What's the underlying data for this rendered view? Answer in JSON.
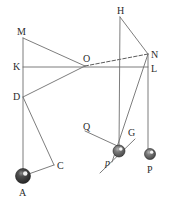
{
  "figure": {
    "width": 172,
    "height": 203,
    "background": "#ffffff",
    "stroke_color": "#6e6e6e",
    "stroke_color_dark": "#4a4a4a",
    "label_color": "#2b2b2b",
    "ball_dark": "#2e2e2e",
    "ball_mid": "#6a6a6a",
    "ball_highlight": "#ffffff"
  },
  "points": {
    "M": {
      "x": 23,
      "y": 38,
      "label": "M",
      "label_x": 17,
      "label_y": 27,
      "italic": false
    },
    "K": {
      "x": 23,
      "y": 67,
      "label": "K",
      "label_x": 13,
      "label_y": 62,
      "italic": false
    },
    "D": {
      "x": 23,
      "y": 97,
      "label": "D",
      "label_x": 13,
      "label_y": 92,
      "italic": false
    },
    "A": {
      "x": 23,
      "y": 176,
      "label": "A",
      "label_x": 19,
      "label_y": 188,
      "italic": false
    },
    "C": {
      "x": 54,
      "y": 165,
      "label": "C",
      "label_x": 57,
      "label_y": 161,
      "italic": false
    },
    "O": {
      "x": 85,
      "y": 66,
      "label": "O",
      "label_x": 83,
      "label_y": 54,
      "italic": false
    },
    "H": {
      "x": 120,
      "y": 17,
      "label": "H",
      "label_x": 117,
      "label_y": 6,
      "italic": false
    },
    "N": {
      "x": 148,
      "y": 54,
      "label": "N",
      "label_x": 151,
      "label_y": 50,
      "italic": false
    },
    "L": {
      "x": 148,
      "y": 67,
      "label": "L",
      "label_x": 151,
      "label_y": 64,
      "italic": false
    },
    "Q": {
      "x": 87,
      "y": 128,
      "label": "Q",
      "label_x": 83,
      "label_y": 122,
      "italic": false
    },
    "G": {
      "x": 129,
      "y": 133,
      "label": "G",
      "label_x": 128,
      "label_y": 128,
      "italic": false
    },
    "p": {
      "x": 119,
      "y": 151,
      "label": "p",
      "label_x": 105,
      "label_y": 158,
      "italic": true
    },
    "P": {
      "x": 150,
      "y": 154,
      "label": "P",
      "label_x": 147,
      "label_y": 165,
      "italic": false
    }
  },
  "balls": [
    {
      "name": "ball-A",
      "cx": 23,
      "cy": 176,
      "r": 7.5,
      "style": "dark"
    },
    {
      "name": "ball-p",
      "cx": 119,
      "cy": 151,
      "r": 6.0,
      "style": "mid"
    },
    {
      "name": "ball-P",
      "cx": 150,
      "cy": 154,
      "r": 5.5,
      "style": "mid"
    }
  ],
  "segments": [
    {
      "name": "line-M-K-D-A",
      "x1": 23,
      "y1": 38,
      "x2": 23,
      "y2": 176,
      "dashed": false
    },
    {
      "name": "line-K-L",
      "x1": 23,
      "y1": 67,
      "x2": 148,
      "y2": 67,
      "dashed": false
    },
    {
      "name": "line-M-O",
      "x1": 23,
      "y1": 38,
      "x2": 85,
      "y2": 66,
      "dashed": false
    },
    {
      "name": "line-D-O",
      "x1": 23,
      "y1": 97,
      "x2": 85,
      "y2": 66,
      "dashed": false
    },
    {
      "name": "line-O-N",
      "x1": 85,
      "y1": 66,
      "x2": 148,
      "y2": 54,
      "dashed": true
    },
    {
      "name": "line-H-N",
      "x1": 120,
      "y1": 17,
      "x2": 148,
      "y2": 54,
      "dashed": false
    },
    {
      "name": "line-H-p",
      "x1": 120,
      "y1": 17,
      "x2": 119,
      "y2": 151,
      "dashed": false
    },
    {
      "name": "line-N-L-P",
      "x1": 148,
      "y1": 54,
      "x2": 148,
      "y2": 154,
      "dashed": false
    },
    {
      "name": "line-N-p",
      "x1": 148,
      "y1": 54,
      "x2": 112,
      "y2": 162,
      "dashed": false
    },
    {
      "name": "line-D-C",
      "x1": 23,
      "y1": 97,
      "x2": 54,
      "y2": 165,
      "dashed": false
    },
    {
      "name": "line-C-A",
      "x1": 54,
      "y1": 165,
      "x2": 23,
      "y2": 176,
      "dashed": false
    },
    {
      "name": "line-Q-p",
      "x1": 85,
      "y1": 131,
      "x2": 124,
      "y2": 149,
      "dashed": false
    },
    {
      "name": "line-tangent-p",
      "x1": 100,
      "y1": 173,
      "x2": 135,
      "y2": 139,
      "dashed": false
    }
  ],
  "labels_order": [
    "M",
    "K",
    "D",
    "A",
    "C",
    "O",
    "H",
    "N",
    "L",
    "Q",
    "G",
    "p",
    "P"
  ]
}
